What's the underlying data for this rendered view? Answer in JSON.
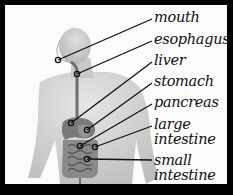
{
  "diagram": {
    "labels": [
      {
        "id": "mouth",
        "text": "mouth"
      },
      {
        "id": "esophagus",
        "text": "esophagus"
      },
      {
        "id": "liver",
        "text": "liver"
      },
      {
        "id": "stomach",
        "text": "stomach"
      },
      {
        "id": "pancreas",
        "text": "pancreas"
      },
      {
        "id": "large-intestine",
        "line1": "large",
        "line2": "intestine"
      },
      {
        "id": "small-intestine",
        "line1": "small",
        "line2": "intestine"
      }
    ],
    "colors": {
      "border": "#000000",
      "background": "#fbfbfb",
      "skin": "#d4d4d4",
      "organs": "#7a7a7a",
      "leader_lines": "#111111"
    }
  }
}
